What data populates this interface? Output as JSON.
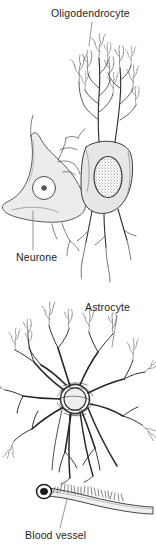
{
  "figure": {
    "background_color": "#ffffff",
    "ink_color": "#1d1d1d",
    "cytoplasm_fill": "#ebebeb",
    "nucleus_fill": "#f7f7f7"
  },
  "labels": {
    "oligodendrocyte": "Oligodendrocyte",
    "neurone": "Neurone",
    "astrocyte": "Astrocyte",
    "blood_vessel": "Blood vessel"
  },
  "panels": [
    {
      "name": "upper-panel",
      "structures": [
        "oligodendrocyte",
        "neurone"
      ]
    },
    {
      "name": "lower-panel",
      "structures": [
        "astrocyte",
        "blood vessel"
      ]
    }
  ]
}
